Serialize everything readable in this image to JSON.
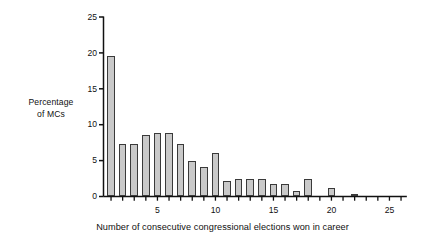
{
  "chart_data": {
    "type": "bar",
    "title": "",
    "subtitle": "",
    "xlabel": "Number of consecutive congressional elections won in career",
    "ylabel": "Percentage of MCs",
    "ylabel_lines": [
      "Percentage",
      "of MCs"
    ],
    "categories": [
      1,
      2,
      3,
      4,
      5,
      6,
      7,
      8,
      9,
      10,
      11,
      12,
      13,
      14,
      15,
      16,
      17,
      18,
      19,
      20,
      21,
      22,
      23,
      24,
      25,
      26
    ],
    "values": [
      19.6,
      7.3,
      7.3,
      8.5,
      8.9,
      8.9,
      7.3,
      4.9,
      4.1,
      6.1,
      2.1,
      2.5,
      2.5,
      2.5,
      1.7,
      1.7,
      0.8,
      2.5,
      0,
      1.2,
      0,
      0.4,
      0,
      0,
      0,
      0
    ],
    "xlim": [
      0.35,
      26.5
    ],
    "ylim": [
      0,
      25
    ],
    "y_ticks": [
      0,
      5,
      10,
      15,
      20,
      25
    ],
    "y_tick_labels": [
      "0",
      "5",
      "10",
      "15",
      "20",
      "25"
    ],
    "x_ticks": [
      1,
      2,
      3,
      4,
      5,
      6,
      7,
      8,
      9,
      10,
      11,
      12,
      13,
      14,
      15,
      16,
      17,
      18,
      19,
      20,
      21,
      22,
      23,
      24,
      25,
      26
    ],
    "x_tick_labels_shown": [
      {
        "x": 5,
        "label": "5"
      },
      {
        "x": 10,
        "label": "10"
      },
      {
        "x": 15,
        "label": "15"
      },
      {
        "x": 20,
        "label": "20"
      },
      {
        "x": 25,
        "label": "25"
      }
    ],
    "grid": false,
    "legend": null,
    "bar_fill_color": "#c9c9c9",
    "bar_edge_color": "#3a3a3a",
    "axis_color": "#111111",
    "background_color": "#ffffff"
  }
}
